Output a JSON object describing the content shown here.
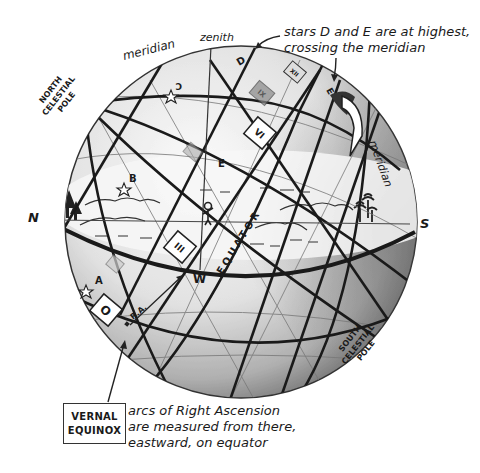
{
  "diagram": {
    "type": "celestial-sphere",
    "labels": {
      "meridian_top": "meridian",
      "meridian_right": "meridian",
      "zenith": "zenith",
      "north_celestial_pole": [
        "NORTH",
        "CELESTIAL",
        "POLE"
      ],
      "south_celestial_pole": [
        "SOUTH",
        "CELESTIAL",
        "POLE"
      ],
      "north": "N",
      "south": "S",
      "west": "W",
      "equator": "EQUATOR",
      "right_ascension": "R.A."
    },
    "stars": [
      {
        "label": "A"
      },
      {
        "label": "B"
      },
      {
        "label": "C"
      },
      {
        "label": "D"
      },
      {
        "label": "E"
      }
    ],
    "hour_markers": [
      {
        "label": "O"
      },
      {
        "label": "III"
      },
      {
        "label": "VI"
      },
      {
        "label": "IX"
      },
      {
        "label": "XII"
      }
    ],
    "annotation_top": {
      "line1": "stars D and E are at highest,",
      "line2": "crossing the meridian"
    },
    "vernal_equinox": {
      "line1": "VERNAL",
      "line2": "EQUINOX"
    },
    "annotation_bottom": {
      "line1": "arcs of Right Ascension",
      "line2": "are measured from there,",
      "line3": "eastward, on equator"
    },
    "colors": {
      "ink": "#1a1a1a",
      "sphere_light": "#f2f2f2",
      "sphere_shade": "#9a9a9a",
      "background": "#ffffff"
    }
  }
}
